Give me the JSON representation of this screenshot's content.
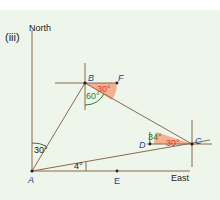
{
  "figure": {
    "part_label": "(iii)",
    "north_label": "North",
    "east_label": "East"
  },
  "points": {
    "A": "A",
    "B": "B",
    "C": "C",
    "D": "D",
    "E": "E",
    "F": "F"
  },
  "angles": {
    "north_A_B": "30°",
    "B_60": "60°",
    "B_F_30": "30°",
    "D_34": "34°",
    "C_30": "30°",
    "A_E_4": "4°"
  },
  "colors": {
    "background": "#eef5ea",
    "line": "#7a5a3a",
    "point_label": "#1e3f8a",
    "angle_green": "#2e7d32",
    "angle_orange_fill": "#f4a582",
    "angle_orange_text": "#e2361b"
  }
}
